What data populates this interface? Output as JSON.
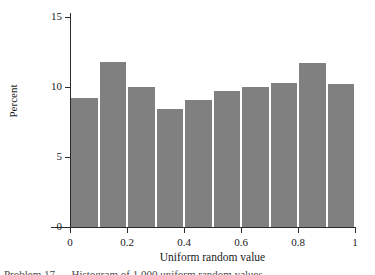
{
  "figure": {
    "background_color": "#ffffff",
    "bar_color": "#808080",
    "axis_color": "#2b2b2b",
    "caption_partial": "Problem 17 — Histogram of 1,000 uniform random values"
  },
  "chart_data": {
    "type": "bar",
    "title": "",
    "subtitle": "",
    "xlabel": "Uniform random value",
    "ylabel": "Percent",
    "xlim": [
      0,
      1
    ],
    "ylim": [
      0,
      15
    ],
    "xticks": [
      0,
      0.2,
      0.4,
      0.6,
      0.8,
      1
    ],
    "xtick_labels": [
      "0",
      "0.2",
      "0.4",
      "0.6",
      "0.8",
      "1"
    ],
    "yticks": [
      0,
      5,
      10,
      15
    ],
    "ytick_labels": [
      "0",
      "5",
      "10",
      "15"
    ],
    "grid": false,
    "legend": null,
    "bin_width": 0.1,
    "bin_edges": [
      0,
      0.1,
      0.2,
      0.3,
      0.4,
      0.5,
      0.6,
      0.7,
      0.8,
      0.9,
      1.0
    ],
    "categories": [
      "0.0-0.1",
      "0.1-0.2",
      "0.2-0.3",
      "0.3-0.4",
      "0.4-0.5",
      "0.5-0.6",
      "0.6-0.7",
      "0.7-0.8",
      "0.8-0.9",
      "0.9-1.0"
    ],
    "values": [
      9.2,
      11.8,
      10.0,
      8.4,
      9.1,
      9.7,
      10.0,
      10.3,
      11.7,
      10.2
    ],
    "bars": [
      {
        "bin_start": 0.0,
        "bin_end": 0.1,
        "value": 9.2
      },
      {
        "bin_start": 0.1,
        "bin_end": 0.2,
        "value": 11.8
      },
      {
        "bin_start": 0.2,
        "bin_end": 0.3,
        "value": 10.0
      },
      {
        "bin_start": 0.3,
        "bin_end": 0.4,
        "value": 8.4
      },
      {
        "bin_start": 0.4,
        "bin_end": 0.5,
        "value": 9.1
      },
      {
        "bin_start": 0.5,
        "bin_end": 0.6,
        "value": 9.7
      },
      {
        "bin_start": 0.6,
        "bin_end": 0.7,
        "value": 10.0
      },
      {
        "bin_start": 0.7,
        "bin_end": 0.8,
        "value": 10.3
      },
      {
        "bin_start": 0.8,
        "bin_end": 0.9,
        "value": 11.7
      },
      {
        "bin_start": 0.9,
        "bin_end": 1.0,
        "value": 10.2
      }
    ]
  }
}
